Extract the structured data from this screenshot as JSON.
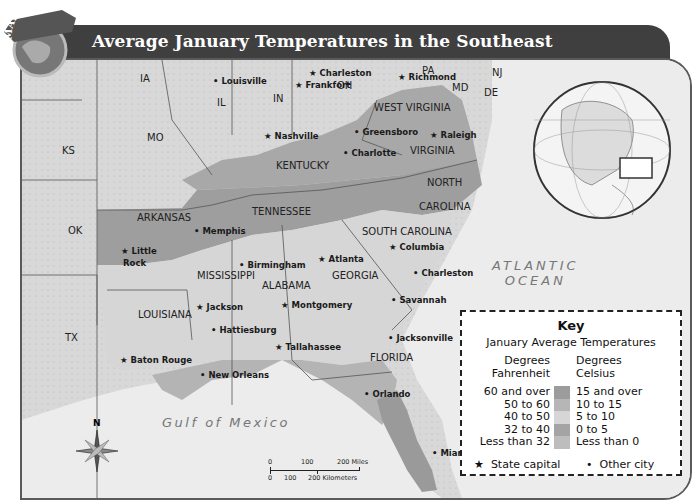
{
  "badge": {
    "label": "MAP SKILL"
  },
  "title": "Average January Temperatures in the Southeast",
  "colors": {
    "band_60_over": "#9a9a9a",
    "band_50_60": "#b4b4b4",
    "band_40_50": "#d4d4d4",
    "band_32_40": "#a8a8a8",
    "band_less_32": "#c2c2c2",
    "water": "#ececec",
    "other_states": "#d6d6d6"
  },
  "states": [
    {
      "abbr": "IA",
      "x": 118,
      "y": 13
    },
    {
      "abbr": "IL",
      "x": 195,
      "y": 37
    },
    {
      "abbr": "IN",
      "x": 251,
      "y": 33
    },
    {
      "abbr": "OH",
      "x": 315,
      "y": 20
    },
    {
      "abbr": "PA",
      "x": 400,
      "y": 5
    },
    {
      "abbr": "NJ",
      "x": 470,
      "y": 7
    },
    {
      "abbr": "MD",
      "x": 430,
      "y": 22
    },
    {
      "abbr": "DE",
      "x": 462,
      "y": 27
    },
    {
      "abbr": "MO",
      "x": 125,
      "y": 72
    },
    {
      "abbr": "KS",
      "x": 40,
      "y": 85
    },
    {
      "abbr": "OK",
      "x": 46,
      "y": 165
    },
    {
      "abbr": "TX",
      "x": 43,
      "y": 272
    },
    {
      "abbr": "WEST VIRGINIA",
      "x": 352,
      "y": 42
    },
    {
      "abbr": "VIRGINIA",
      "x": 388,
      "y": 85
    },
    {
      "abbr": "KENTUCKY",
      "x": 254,
      "y": 100
    },
    {
      "abbr": "TENNESSEE",
      "x": 230,
      "y": 146
    },
    {
      "abbr": "NORTH",
      "x": 405,
      "y": 117
    },
    {
      "abbr": "CAROLINA",
      "x": 397,
      "y": 141
    },
    {
      "abbr": "ARKANSAS",
      "x": 115,
      "y": 152
    },
    {
      "abbr": "SOUTH CAROLINA",
      "x": 340,
      "y": 166
    },
    {
      "abbr": "MISSISSIPPI",
      "x": 175,
      "y": 210
    },
    {
      "abbr": "ALABAMA",
      "x": 240,
      "y": 220
    },
    {
      "abbr": "GEORGIA",
      "x": 310,
      "y": 210
    },
    {
      "abbr": "LOUISIANA",
      "x": 116,
      "y": 249
    },
    {
      "abbr": "FLORIDA",
      "x": 348,
      "y": 292
    }
  ],
  "cities": [
    {
      "name": "Arlington",
      "type": "other",
      "x": 396,
      "y": 36
    },
    {
      "name": "Charleston",
      "type": "capital",
      "x": 307,
      "y": 66
    },
    {
      "name": "Louisville",
      "type": "other",
      "x": 211,
      "y": 74
    },
    {
      "name": "Frankfort",
      "type": "capital",
      "x": 293,
      "y": 78
    },
    {
      "name": "Richmond",
      "type": "capital",
      "x": 396,
      "y": 70
    },
    {
      "name": "Nashville",
      "type": "capital",
      "x": 262,
      "y": 129
    },
    {
      "name": "Greensboro",
      "type": "other",
      "x": 352,
      "y": 125
    },
    {
      "name": "Raleigh",
      "type": "capital",
      "x": 428,
      "y": 128
    },
    {
      "name": "Charlotte",
      "type": "other",
      "x": 341,
      "y": 146
    },
    {
      "name": "Memphis",
      "type": "other",
      "x": 192,
      "y": 224
    },
    {
      "name": "Columbia",
      "type": "capital",
      "x": 387,
      "y": 240
    },
    {
      "name": "Little",
      "type": "capital",
      "x": 119,
      "y": 244
    },
    {
      "name": "Rock",
      "type": "label",
      "x": 121,
      "y": 256
    },
    {
      "name": "Atlanta",
      "type": "capital",
      "x": 316,
      "y": 252
    },
    {
      "name": "Birmingham",
      "type": "other",
      "x": 237,
      "y": 258
    },
    {
      "name": "Charleston",
      "type": "other",
      "x": 411,
      "y": 266
    },
    {
      "name": "Savannah",
      "type": "other",
      "x": 389,
      "y": 293
    },
    {
      "name": "Jackson",
      "type": "capital",
      "x": 194,
      "y": 300
    },
    {
      "name": "Montgomery",
      "type": "capital",
      "x": 279,
      "y": 298
    },
    {
      "name": "Hattiesburg",
      "type": "other",
      "x": 209,
      "y": 323
    },
    {
      "name": "Jacksonville",
      "type": "other",
      "x": 386,
      "y": 331
    },
    {
      "name": "Tallahassee",
      "type": "capital",
      "x": 273,
      "y": 340
    },
    {
      "name": "Baton Rouge",
      "type": "capital",
      "x": 118,
      "y": 353
    },
    {
      "name": "New Orleans",
      "type": "other",
      "x": 198,
      "y": 368
    },
    {
      "name": "Orlando",
      "type": "other",
      "x": 362,
      "y": 387
    },
    {
      "name": "Miami",
      "type": "other",
      "x": 430,
      "y": 446
    }
  ],
  "water_labels": {
    "atlantic_line1": "ATLANTIC",
    "atlantic_line2": "OCEAN",
    "gulf": "Gulf of Mexico"
  },
  "compass": {
    "north_label": "N"
  },
  "scale": {
    "miles_ticks": [
      "0",
      "100",
      "200 Miles"
    ],
    "km_ticks": [
      "0",
      "100",
      "200 Kilometers"
    ]
  },
  "key": {
    "title": "Key",
    "subtitle": "January Average Temperatures",
    "fahrenheit_header_1": "Degrees",
    "fahrenheit_header_2": "Fahrenheit",
    "celsius_header_1": "Degrees",
    "celsius_header_2": "Celsius",
    "ranges": [
      {
        "f": "60 and over",
        "c": "15 and over",
        "color": "#9c9c9c"
      },
      {
        "f": "50 to 60",
        "c": "10 to 15",
        "color": "#b6b6b6"
      },
      {
        "f": "40 to 50",
        "c": "5 to 10",
        "color": "#d6d6d6"
      },
      {
        "f": "32 to  40",
        "c": "0 to 5",
        "color": "#a4a4a4"
      },
      {
        "f": "Less than 32",
        "c": "Less than 0",
        "color": "#bdbdbd"
      }
    ],
    "capital_symbol": "★",
    "capital_label": "State capital",
    "city_symbol": "•",
    "city_label": "Other city"
  }
}
